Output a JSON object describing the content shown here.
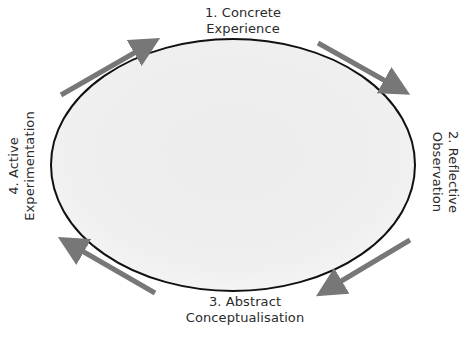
{
  "diagram": {
    "stages": [
      {
        "number": "1.",
        "line1": "1. Concrete",
        "line2": "Experience",
        "position": "top"
      },
      {
        "number": "2.",
        "line1": "2. Reflective",
        "line2": "Observation",
        "position": "right"
      },
      {
        "number": "3.",
        "line1": "3. Abstract",
        "line2": "Conceptualisation",
        "position": "bottom"
      },
      {
        "number": "4.",
        "line1": "4. Active",
        "line2": "Experimentation",
        "position": "left"
      }
    ],
    "cycle_direction": "clockwise",
    "arrows": [
      {
        "from": "4. Active Experimentation",
        "to": "1. Concrete Experience",
        "location": "top-left"
      },
      {
        "from": "1. Concrete Experience",
        "to": "2. Reflective Observation",
        "location": "top-right"
      },
      {
        "from": "2. Reflective Observation",
        "to": "3. Abstract Conceptualisation",
        "location": "bottom-right"
      },
      {
        "from": "3. Abstract Conceptualisation",
        "to": "4. Active Experimentation",
        "location": "bottom-left"
      }
    ],
    "colors": {
      "ellipse_fill": "#efefef",
      "ellipse_stroke": "#111111",
      "arrow": "#777777",
      "text": "#2b2b2b",
      "background": "#ffffff"
    }
  }
}
